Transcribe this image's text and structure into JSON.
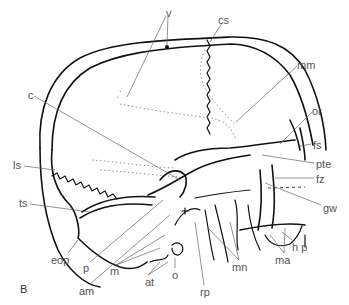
{
  "figure": {
    "panel_label": "B",
    "labels": [
      {
        "id": "v",
        "text": "v",
        "x": 166,
        "y": 8
      },
      {
        "id": "cs",
        "text": "cs",
        "x": 218,
        "y": 15
      },
      {
        "id": "c",
        "text": "c",
        "x": 28,
        "y": 90
      },
      {
        "id": "mm",
        "text": "mm",
        "x": 297,
        "y": 60
      },
      {
        "id": "or",
        "text": "or",
        "x": 312,
        "y": 106
      },
      {
        "id": "fs",
        "text": "fs",
        "x": 313,
        "y": 140
      },
      {
        "id": "ls",
        "text": "ls",
        "x": 13,
        "y": 160
      },
      {
        "id": "pte",
        "text": "pte",
        "x": 316,
        "y": 159
      },
      {
        "id": "fz",
        "text": "fz",
        "x": 316,
        "y": 174
      },
      {
        "id": "ts",
        "text": "ts",
        "x": 19,
        "y": 198
      },
      {
        "id": "gw",
        "text": "gw",
        "x": 323,
        "y": 203
      },
      {
        "id": "eop",
        "text": "eop",
        "x": 51,
        "y": 255
      },
      {
        "id": "hp",
        "text": "h p",
        "x": 292,
        "y": 242
      },
      {
        "id": "ma",
        "text": "ma",
        "x": 275,
        "y": 255
      },
      {
        "id": "p",
        "text": "p",
        "x": 83,
        "y": 263
      },
      {
        "id": "mn",
        "text": "mn",
        "x": 232,
        "y": 262
      },
      {
        "id": "m",
        "text": "m",
        "x": 110,
        "y": 266
      },
      {
        "id": "o",
        "text": "o",
        "x": 172,
        "y": 270
      },
      {
        "id": "at",
        "text": "at",
        "x": 145,
        "y": 277
      },
      {
        "id": "am",
        "text": "am",
        "x": 79,
        "y": 286
      },
      {
        "id": "rp",
        "text": "rp",
        "x": 200,
        "y": 287
      }
    ]
  }
}
